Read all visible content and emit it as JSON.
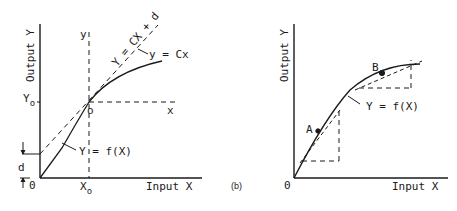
{
  "diagram_a": {
    "y_axis_label": "Output Y",
    "x_axis_label": "Input X",
    "local_y_label": "y",
    "local_x_label": "x",
    "local_origin_label": "o",
    "tangent_label": "Y = CX + d",
    "local_line_label": "y = Cx",
    "curve_label": "Y = f(X)",
    "y0_label": "Y",
    "y0_sub": "o",
    "x0_label": "X",
    "x0_sub": "o",
    "origin_label": "0",
    "offset_label": "d"
  },
  "diagram_b": {
    "panel_label": "(b)",
    "y_axis_label": "Output Y",
    "x_axis_label": "Input X",
    "origin_label": "0",
    "point_a_label": "A",
    "point_b_label": "B",
    "curve_label": "Y = f(X)"
  },
  "colors": {
    "ink": "#1a1a1a",
    "background": "#ffffff"
  }
}
